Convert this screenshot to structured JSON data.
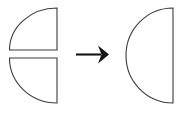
{
  "figure": {
    "type": "geometry-composition-diagram",
    "caption": "",
    "background_color": "#ffffff",
    "stroke_color": "#3b3b3b",
    "arrow_color": "#151515",
    "width": 185,
    "height": 116
  },
  "shapes": {
    "top_left": {
      "name": "quarter-circle",
      "label": "",
      "description": "Upper quarter circle, right angle at bottom-right, arc bulging to upper-left",
      "right_angle_corner": "bottom-right",
      "arc_bulge": "upper-left",
      "bounds": {
        "x": 9,
        "y": 8,
        "width": 48,
        "height": 42
      },
      "fill": "#ffffff",
      "stroke": "#3b3b3b"
    },
    "bottom_left": {
      "name": "quarter-circle",
      "label": "",
      "description": "Lower quarter circle, right angle at top-right, arc bulging to lower-left",
      "right_angle_corner": "top-right",
      "arc_bulge": "lower-left",
      "bounds": {
        "x": 9,
        "y": 58,
        "width": 48,
        "height": 45
      },
      "fill": "#ffffff",
      "stroke": "#3b3b3b"
    },
    "result": {
      "name": "semicircle",
      "label": "",
      "description": "Half circle with vertical flat edge on the right, arc bulging to the left",
      "flat_edge": "right",
      "arc_bulge": "left",
      "bounds": {
        "x": 126,
        "y": 8,
        "width": 47,
        "height": 95
      },
      "fill": "#ffffff",
      "stroke": "#3b3b3b"
    }
  },
  "arrow": {
    "name": "right-arrow",
    "label": "",
    "direction": "right",
    "from_x": 76,
    "to_x": 108,
    "y": 54,
    "color": "#151515"
  },
  "accessibility": {
    "summary": "Two quarter circles combine into one semicircle"
  }
}
